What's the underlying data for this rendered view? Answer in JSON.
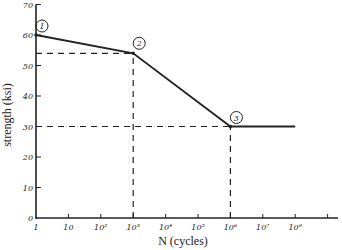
{
  "chart_data": {
    "type": "line",
    "title": "",
    "xlabel": "N (cycles)",
    "ylabel": "strength (ksi)",
    "x_scale": "log",
    "xlim": [
      1,
      1000000000
    ],
    "ylim": [
      0,
      70
    ],
    "grid": false,
    "x_tick_labels": [
      "1",
      "10",
      "10²",
      "10³",
      "10⁴",
      "10⁵",
      "10⁶",
      "10⁷",
      "10⁸"
    ],
    "y_tick_labels": [
      "0",
      "10",
      "20",
      "30",
      "40",
      "50",
      "60",
      "70"
    ],
    "series": [
      {
        "name": "S-N curve",
        "x": [
          1,
          1000,
          1000000,
          100000000
        ],
        "y": [
          60,
          54,
          30,
          30
        ]
      }
    ],
    "points": [
      {
        "label": "1",
        "x": 1,
        "y": 60
      },
      {
        "label": "2",
        "x": 1000,
        "y": 54
      },
      {
        "label": "3",
        "x": 1000000,
        "y": 30
      }
    ],
    "reference_lines": [
      {
        "type": "horizontal-dashed",
        "y": 54,
        "x_from": 1,
        "x_to": 1000
      },
      {
        "type": "vertical-dashed",
        "x": 1000,
        "y_from": 0,
        "y_to": 54
      },
      {
        "type": "horizontal-dashed",
        "y": 30,
        "x_from": 1,
        "x_to": 1000000
      },
      {
        "type": "vertical-dashed",
        "x": 1000000,
        "y_from": 0,
        "y_to": 30
      }
    ]
  },
  "labels": {
    "xlabel": "N (cycles)",
    "ylabel": "strength (ksi)",
    "p1": "1",
    "p2": "2",
    "p3": "3"
  }
}
